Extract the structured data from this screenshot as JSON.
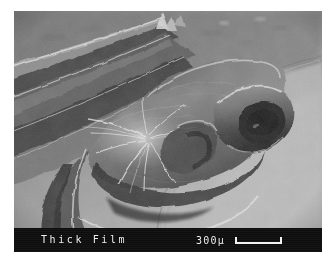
{
  "figure": {
    "kind": "sem-micrograph",
    "medium": "scanning electron microscope image",
    "subject": "wrinkled thick film delaminating and folding away from a smooth substrate",
    "frame": {
      "x": 14,
      "y": 11,
      "width": 308,
      "height": 241
    },
    "palette": {
      "page_background": "#ffffff",
      "substrate_mid_gray": "#9a9a9a",
      "substrate_light_gray": "#b4b4b4",
      "fold_shadow_dark": "#2a2a2a",
      "crease_highlight": "#f2f2f2",
      "annotation_band": "#0d0d0d",
      "annotation_text": "#f0f0f0"
    }
  },
  "annotation": {
    "specimen_label": "Thick Film",
    "scale_value": "300µ",
    "scale_magnitude": 300,
    "scale_unit": "µ",
    "scale_bar_length_px": 47
  }
}
